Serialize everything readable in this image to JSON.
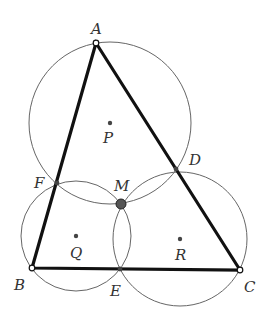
{
  "diagram": {
    "colors": {
      "triangle": "#111111",
      "circle": "#666666",
      "point": "#444444",
      "background": "#ffffff"
    },
    "points": {
      "A": {
        "label": "A",
        "x": 96,
        "y": 43,
        "style": "open"
      },
      "B": {
        "label": "B",
        "x": 32,
        "y": 268,
        "style": "open"
      },
      "C": {
        "label": "C",
        "x": 240,
        "y": 270,
        "style": "open"
      },
      "D": {
        "label": "D",
        "x": 176,
        "y": 169,
        "style": "small"
      },
      "E": {
        "label": "E",
        "x": 120,
        "y": 269,
        "style": "small"
      },
      "F": {
        "label": "F",
        "x": 57,
        "y": 183,
        "style": "small"
      },
      "M": {
        "label": "M",
        "x": 121,
        "y": 204,
        "style": "large"
      },
      "P": {
        "label": "P",
        "x": 110,
        "y": 123,
        "style": "center"
      },
      "Q": {
        "label": "Q",
        "x": 76,
        "y": 236,
        "style": "center"
      },
      "R": {
        "label": "R",
        "x": 180,
        "y": 239,
        "style": "center"
      }
    },
    "circles": [
      {
        "center": "P",
        "r": 81
      },
      {
        "center": "Q",
        "r": 55
      },
      {
        "center": "R",
        "r": 67
      }
    ],
    "segments": [
      [
        "A",
        "B"
      ],
      [
        "B",
        "C"
      ],
      [
        "C",
        "A"
      ]
    ]
  }
}
